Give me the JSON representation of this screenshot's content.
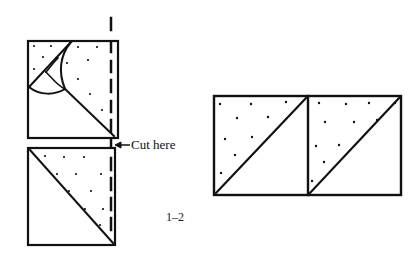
{
  "diagram": {
    "cut_label": "Cut here",
    "figure_label": "1–2",
    "colors": {
      "ink": "#111111",
      "background": "#ffffff"
    },
    "panels": [
      {
        "name": "top-folded-square",
        "description": "Square folded along diagonal with dotted triangle and curled corner"
      },
      {
        "name": "bottom-square",
        "description": "Square divided diagonally, dotted upper-right triangle"
      },
      {
        "name": "two-triangle-squares",
        "description": "Two joined squares each split by diagonal, dotted upper-left triangles"
      }
    ]
  }
}
